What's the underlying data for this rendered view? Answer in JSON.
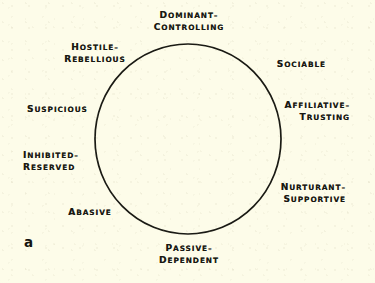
{
  "figure": {
    "letter": "a",
    "type": "interpersonal-circumplex",
    "background_color": "#fdfce9",
    "stroke_color": "#1a1a14",
    "text_color": "#181812"
  },
  "circle": {
    "center_x": 188,
    "center_y": 139,
    "radius_x": 93,
    "radius_y": 95,
    "stroke_width": 1.7
  },
  "labels": [
    {
      "id": "dominant-controlling",
      "line1": "Dominant–",
      "line2": "Controlling",
      "angle_deg": 90,
      "align": "center"
    },
    {
      "id": "hostile-rebellious",
      "line1": "Hostile–",
      "line2": "Rebellious",
      "angle_deg": 135,
      "align": "center"
    },
    {
      "id": "suspicious",
      "line1": "Suspicious",
      "line2": "",
      "angle_deg": 180,
      "align": "left"
    },
    {
      "id": "inhibited-reserved",
      "line1": "Inhibited–",
      "line2": "Reserved",
      "angle_deg": 215,
      "align": "left"
    },
    {
      "id": "abasive",
      "line1": "Abasive",
      "line2": "",
      "angle_deg": 245,
      "align": "center"
    },
    {
      "id": "passive-dependent",
      "line1": "Passive–",
      "line2": "Dependent",
      "angle_deg": 270,
      "align": "center"
    },
    {
      "id": "nurturant-supportive",
      "line1": "Nurturant–",
      "line2": "Supportive",
      "angle_deg": 325,
      "align": "right"
    },
    {
      "id": "affiliative-trusting",
      "line1": "Affiliative–",
      "line2": "Trusting",
      "angle_deg": 0,
      "align": "right"
    },
    {
      "id": "sociable",
      "line1": "Sociable",
      "line2": "",
      "angle_deg": 42,
      "align": "right"
    }
  ],
  "label_positions": {
    "dominant-controlling": {
      "left": 150,
      "top": 10,
      "width": 78
    },
    "hostile-rebellious": {
      "left": 62,
      "top": 42,
      "width": 66
    },
    "suspicious": {
      "left": 27,
      "top": 104,
      "width": 64
    },
    "inhibited-reserved": {
      "left": 23,
      "top": 150,
      "width": 62
    },
    "abasive": {
      "left": 64,
      "top": 207,
      "width": 52
    },
    "passive-dependent": {
      "left": 150,
      "top": 243,
      "width": 78
    },
    "nurturant-supportive": {
      "left": 272,
      "top": 182,
      "width": 74
    },
    "affiliative-trusting": {
      "left": 272,
      "top": 100,
      "width": 78
    },
    "sociable": {
      "left": 268,
      "top": 59,
      "width": 58
    }
  }
}
